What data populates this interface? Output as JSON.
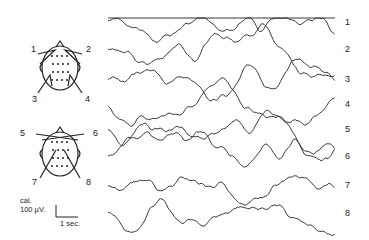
{
  "figure": {
    "channel_labels": [
      "1",
      "2",
      "3",
      "4",
      "5",
      "6",
      "7",
      "8"
    ],
    "montage_top": {
      "labels": [
        "1",
        "2",
        "3",
        "4"
      ]
    },
    "montage_bottom": {
      "labels": [
        "5",
        "6",
        "7",
        "8"
      ]
    },
    "calibration": {
      "title": "cal.",
      "amplitude": "100 µV.",
      "time": "1 sec."
    },
    "ink_color": "#222222"
  }
}
